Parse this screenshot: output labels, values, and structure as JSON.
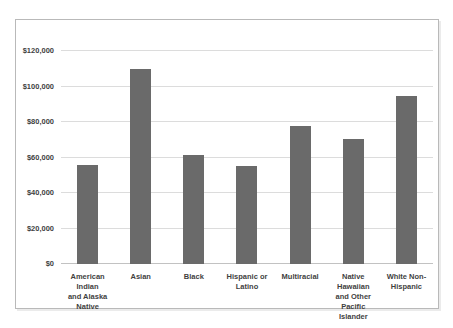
{
  "chart_data": {
    "type": "bar",
    "title": "",
    "xlabel": "",
    "ylabel": "",
    "categories": [
      "American Indian and Alaska Native",
      "Asian",
      "Black",
      "Hispanic or Latino",
      "Multiracial",
      "Native Hawaiian and Other Pacific Islander",
      "White Non-Hispanic"
    ],
    "category_lines": [
      [
        "American Indian",
        "and Alaska",
        "Native"
      ],
      [
        "Asian"
      ],
      [
        "Black"
      ],
      [
        "Hispanic or",
        "Latino"
      ],
      [
        "Multiracial"
      ],
      [
        "Native Hawaiian",
        "and Other Pacific",
        "Islander"
      ],
      [
        "White Non-",
        "Hispanic"
      ]
    ],
    "values": [
      56000,
      110000,
      61500,
      55000,
      78000,
      70500,
      94500
    ],
    "ylim": [
      0,
      120000
    ],
    "ytick_step": 20000,
    "ytick_labels": [
      "$0",
      "$20,000",
      "$40,000",
      "$60,000",
      "$80,000",
      "$100,000",
      "$120,000"
    ],
    "grid": true,
    "legend": false,
    "bar_color": "#6a6a6a"
  },
  "colors": {
    "background": "#ffffff",
    "chart_border": "#b9b9b9",
    "gridline": "#dcdcdc",
    "axis_line": "#c2c2c2",
    "bar": "#6a6a6a",
    "label_text": "#3f3f3f"
  }
}
